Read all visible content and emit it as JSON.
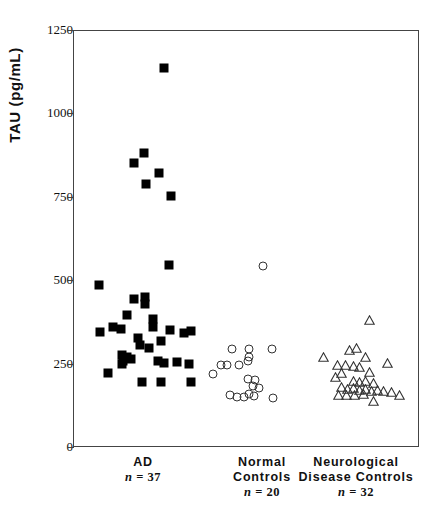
{
  "chart_data": {
    "type": "scatter",
    "title": "",
    "xlabel": "",
    "ylabel": "TAU (pg/mL)",
    "ylim": [
      0,
      1250
    ],
    "yticks": [
      0,
      250,
      500,
      750,
      1000,
      1250
    ],
    "ytick_labels": [
      "0",
      "250",
      "500",
      "750",
      "1000",
      "1250"
    ],
    "grid": false,
    "legend": "none",
    "categories": [
      "AD",
      "Normal Controls",
      "Neurological Disease Controls"
    ],
    "series": [
      {
        "name": "AD",
        "marker": "filled-square",
        "color": "#000000",
        "n": 37,
        "x_center": 143,
        "points": [
          {
            "x": 163,
            "y": 1140
          },
          {
            "x": 143,
            "y": 885
          },
          {
            "x": 133,
            "y": 855
          },
          {
            "x": 158,
            "y": 825
          },
          {
            "x": 145,
            "y": 790
          },
          {
            "x": 170,
            "y": 755
          },
          {
            "x": 168,
            "y": 550
          },
          {
            "x": 98,
            "y": 490
          },
          {
            "x": 133,
            "y": 448
          },
          {
            "x": 144,
            "y": 432
          },
          {
            "x": 144,
            "y": 452
          },
          {
            "x": 126,
            "y": 400
          },
          {
            "x": 152,
            "y": 388
          },
          {
            "x": 112,
            "y": 362
          },
          {
            "x": 120,
            "y": 358
          },
          {
            "x": 152,
            "y": 362
          },
          {
            "x": 99,
            "y": 348
          },
          {
            "x": 169,
            "y": 355
          },
          {
            "x": 183,
            "y": 345
          },
          {
            "x": 190,
            "y": 350
          },
          {
            "x": 137,
            "y": 330
          },
          {
            "x": 139,
            "y": 310
          },
          {
            "x": 148,
            "y": 300
          },
          {
            "x": 160,
            "y": 322
          },
          {
            "x": 121,
            "y": 278
          },
          {
            "x": 126,
            "y": 272
          },
          {
            "x": 122,
            "y": 262
          },
          {
            "x": 130,
            "y": 268
          },
          {
            "x": 157,
            "y": 262
          },
          {
            "x": 163,
            "y": 256
          },
          {
            "x": 121,
            "y": 252
          },
          {
            "x": 176,
            "y": 258
          },
          {
            "x": 188,
            "y": 252
          },
          {
            "x": 107,
            "y": 225
          },
          {
            "x": 141,
            "y": 198
          },
          {
            "x": 160,
            "y": 198
          },
          {
            "x": 190,
            "y": 198
          }
        ]
      },
      {
        "name": "Normal Controls",
        "marker": "open-circle",
        "color": "#333333",
        "n": 20,
        "x_center": 262,
        "points": [
          {
            "x": 262,
            "y": 545
          },
          {
            "x": 231,
            "y": 298
          },
          {
            "x": 248,
            "y": 298
          },
          {
            "x": 271,
            "y": 298
          },
          {
            "x": 248,
            "y": 272
          },
          {
            "x": 220,
            "y": 248
          },
          {
            "x": 226,
            "y": 248
          },
          {
            "x": 238,
            "y": 248
          },
          {
            "x": 247,
            "y": 262
          },
          {
            "x": 212,
            "y": 222
          },
          {
            "x": 247,
            "y": 208
          },
          {
            "x": 254,
            "y": 205
          },
          {
            "x": 252,
            "y": 185
          },
          {
            "x": 258,
            "y": 180
          },
          {
            "x": 229,
            "y": 160
          },
          {
            "x": 236,
            "y": 152
          },
          {
            "x": 243,
            "y": 152
          },
          {
            "x": 248,
            "y": 162
          },
          {
            "x": 253,
            "y": 155
          },
          {
            "x": 272,
            "y": 150
          }
        ]
      },
      {
        "name": "Neurological Disease Controls",
        "marker": "open-triangle",
        "color": "#333333",
        "n": 32,
        "x_center": 356,
        "points": [
          {
            "x": 368,
            "y": 385
          },
          {
            "x": 348,
            "y": 295
          },
          {
            "x": 355,
            "y": 300
          },
          {
            "x": 322,
            "y": 272
          },
          {
            "x": 364,
            "y": 272
          },
          {
            "x": 386,
            "y": 255
          },
          {
            "x": 336,
            "y": 248
          },
          {
            "x": 344,
            "y": 250
          },
          {
            "x": 352,
            "y": 245
          },
          {
            "x": 358,
            "y": 242
          },
          {
            "x": 340,
            "y": 225
          },
          {
            "x": 368,
            "y": 228
          },
          {
            "x": 334,
            "y": 212
          },
          {
            "x": 352,
            "y": 202
          },
          {
            "x": 358,
            "y": 198
          },
          {
            "x": 364,
            "y": 202
          },
          {
            "x": 372,
            "y": 195
          },
          {
            "x": 340,
            "y": 182
          },
          {
            "x": 346,
            "y": 178
          },
          {
            "x": 352,
            "y": 180
          },
          {
            "x": 358,
            "y": 175
          },
          {
            "x": 364,
            "y": 178
          },
          {
            "x": 370,
            "y": 172
          },
          {
            "x": 376,
            "y": 175
          },
          {
            "x": 382,
            "y": 170
          },
          {
            "x": 390,
            "y": 168
          },
          {
            "x": 337,
            "y": 160
          },
          {
            "x": 345,
            "y": 158
          },
          {
            "x": 353,
            "y": 158
          },
          {
            "x": 362,
            "y": 162
          },
          {
            "x": 372,
            "y": 140
          },
          {
            "x": 398,
            "y": 158
          }
        ]
      }
    ]
  },
  "axis": {
    "y_title": "TAU  (pg/mL)",
    "y_tick_labels": [
      "1250",
      "1000",
      "750",
      "500",
      "250",
      "0"
    ]
  },
  "groups": [
    {
      "line1": "AD",
      "line2": "",
      "n_label": "n = 37"
    },
    {
      "line1": "Normal",
      "line2": "Controls",
      "n_label": "n = 20"
    },
    {
      "line1": "Neurological",
      "line2": "Disease  Controls",
      "n_label": "n = 32"
    }
  ]
}
